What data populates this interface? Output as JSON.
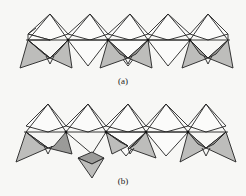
{
  "figure": {
    "panels": [
      {
        "id": "a",
        "label": "(a)",
        "octahedra_count": 5,
        "tetrahedra_pairs": 3,
        "tetrahedra_position": "below chain, paired"
      },
      {
        "id": "b",
        "label": "(b)",
        "octahedra_count": 5,
        "tetrahedra_pairs": 3,
        "tetrahedra_position": "below chain, one tetrahedron displaced downward"
      }
    ]
  },
  "colors": {
    "line": "#222222",
    "background": "#f7f7f5",
    "hatch": "#444444"
  }
}
